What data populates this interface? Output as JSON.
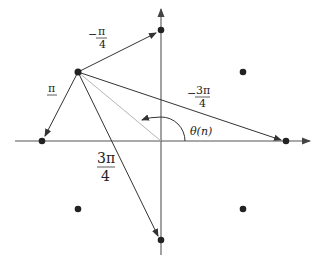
{
  "diagram": {
    "type": "constellation-phase-transitions",
    "colors": {
      "axis": "#555555",
      "arrow": "#333333",
      "point": "#222222",
      "guide": "#b5b5b5",
      "background": "#ffffff"
    },
    "axes": {
      "origin": [
        161,
        141
      ],
      "x_axis": {
        "from": [
          15,
          141
        ],
        "to": [
          310,
          141
        ]
      },
      "y_axis": {
        "from": [
          161,
          255
        ],
        "to": [
          161,
          8
        ]
      }
    },
    "points": [
      {
        "id": "p-top",
        "x": 161,
        "y": 30
      },
      {
        "id": "p-upper-right",
        "x": 243,
        "y": 72
      },
      {
        "id": "p-upper-left",
        "x": 78,
        "y": 72
      },
      {
        "id": "p-left",
        "x": 42,
        "y": 141
      },
      {
        "id": "p-right",
        "x": 286,
        "y": 141
      },
      {
        "id": "p-lower-left",
        "x": 78,
        "y": 209
      },
      {
        "id": "p-lower-right",
        "x": 243,
        "y": 209
      },
      {
        "id": "p-bottom",
        "x": 161,
        "y": 240
      }
    ],
    "transitions": [
      {
        "from": "p-upper-left",
        "to": "p-top",
        "label": {
          "sign": "−",
          "num": "π",
          "den": "4"
        }
      },
      {
        "from": "p-upper-left",
        "to": "p-left",
        "label": {
          "sign": "",
          "num": "π",
          "den": ""
        }
      },
      {
        "from": "p-upper-left",
        "to": "p-right",
        "label": {
          "sign": "−",
          "num": "3π",
          "den": "4"
        }
      },
      {
        "from": "p-upper-left",
        "to": "p-bottom",
        "label": {
          "sign": "",
          "num": "3π",
          "den": "4"
        }
      }
    ],
    "angle": {
      "label": "θ(n)"
    },
    "labels": {
      "minus_pi_over_4": {
        "sign": "−",
        "num": "π",
        "den": "4"
      },
      "pi": {
        "num": "π"
      },
      "minus_3pi_over_4": {
        "sign": "−",
        "num": "3π",
        "den": "4"
      },
      "three_pi_over_4": {
        "num": "3π",
        "den": "4"
      },
      "theta": "θ(n)"
    }
  }
}
